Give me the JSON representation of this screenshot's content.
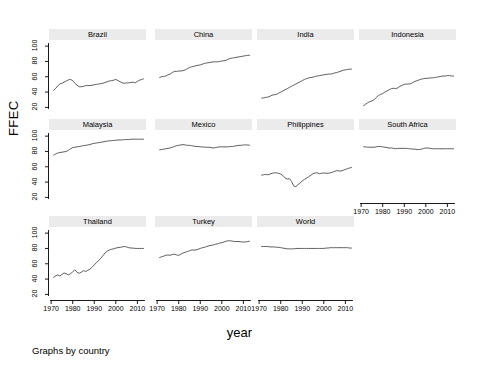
{
  "figure": {
    "ylabel": "FFEC",
    "xlabel": "year",
    "note": "Graphs by country",
    "line_color": "#4d4d4d",
    "title_band_color": "#ebebeb",
    "axis_color": "#000000"
  },
  "axes": {
    "yticks": [
      "100",
      "80",
      "60",
      "40",
      "20"
    ],
    "ytick_values": [
      100,
      80,
      60,
      40,
      20
    ],
    "xticks": [
      "1970",
      "1980",
      "1990",
      "2000",
      "2010"
    ],
    "xtick_values": [
      1970,
      1980,
      1990,
      2000,
      2010
    ],
    "ylim": [
      14,
      108
    ],
    "xlim": [
      1969,
      2014
    ]
  },
  "chart_data": {
    "type": "line",
    "title": "",
    "subtitle": "",
    "xlabel": "year",
    "ylabel": "FFEC",
    "note": "Graphs by country",
    "layout": {
      "rows": 3,
      "cols": 4,
      "shared_x": true,
      "shared_y": true,
      "grid": false,
      "legend": "none"
    },
    "xlim": [
      1969,
      2014
    ],
    "ylim": [
      14,
      108
    ],
    "panel_order": [
      "Brazil",
      "China",
      "India",
      "Indonesia",
      "Malaysia",
      "Mexico",
      "Philippines",
      "South Africa",
      "Thailand",
      "Turkey",
      "World"
    ],
    "x": [
      1971,
      1972,
      1973,
      1974,
      1975,
      1976,
      1977,
      1978,
      1979,
      1980,
      1981,
      1982,
      1983,
      1984,
      1985,
      1986,
      1987,
      1988,
      1989,
      1990,
      1991,
      1992,
      1993,
      1994,
      1995,
      1996,
      1997,
      1998,
      1999,
      2000,
      2001,
      2002,
      2003,
      2004,
      2005,
      2006,
      2007,
      2008,
      2009,
      2010,
      2011,
      2012,
      2013
    ],
    "series": [
      {
        "name": "Brazil",
        "values": [
          42.0,
          44.5,
          48.0,
          50.5,
          51.5,
          53.0,
          54.5,
          56.0,
          56.5,
          55.0,
          51.5,
          49.0,
          47.0,
          47.0,
          47.5,
          48.5,
          48.5,
          48.5,
          49.0,
          49.5,
          50.0,
          50.5,
          51.0,
          51.5,
          52.5,
          53.5,
          54.5,
          55.0,
          55.5,
          56.5,
          55.0,
          53.5,
          52.0,
          51.5,
          52.0,
          52.0,
          52.5,
          53.0,
          52.0,
          54.0,
          55.5,
          56.5,
          57.5
        ]
      },
      {
        "name": "China",
        "values": [
          59.0,
          60.0,
          60.5,
          61.0,
          62.5,
          63.5,
          65.5,
          67.0,
          67.0,
          67.5,
          67.5,
          68.0,
          69.0,
          70.5,
          72.0,
          73.0,
          73.5,
          74.5,
          75.0,
          75.5,
          76.5,
          77.5,
          78.0,
          78.5,
          79.0,
          79.5,
          79.5,
          79.5,
          80.0,
          80.5,
          81.0,
          81.5,
          83.0,
          84.0,
          84.5,
          85.0,
          85.5,
          86.0,
          86.5,
          87.0,
          87.5,
          88.0,
          88.0
        ]
      },
      {
        "name": "India",
        "values": [
          32.0,
          32.5,
          33.0,
          33.5,
          34.5,
          36.0,
          36.5,
          37.0,
          38.5,
          40.0,
          41.5,
          43.0,
          44.5,
          46.0,
          47.5,
          49.0,
          50.5,
          52.0,
          53.5,
          55.0,
          56.5,
          57.5,
          58.5,
          59.0,
          59.5,
          60.5,
          61.0,
          61.5,
          62.0,
          62.5,
          63.0,
          63.5,
          63.5,
          64.0,
          65.0,
          65.5,
          66.5,
          67.5,
          68.5,
          69.0,
          69.5,
          70.0,
          70.0
        ]
      },
      {
        "name": "Indonesia",
        "values": [
          22.0,
          24.0,
          26.0,
          27.5,
          28.5,
          30.0,
          33.0,
          35.5,
          37.0,
          38.0,
          40.0,
          41.5,
          43.0,
          44.5,
          45.0,
          44.5,
          45.5,
          47.5,
          49.0,
          50.0,
          50.5,
          50.5,
          51.0,
          52.5,
          54.0,
          55.0,
          56.0,
          57.0,
          57.5,
          58.0,
          58.0,
          58.5,
          58.5,
          59.0,
          59.5,
          60.0,
          60.5,
          61.0,
          61.0,
          61.5,
          61.5,
          61.0,
          61.0
        ]
      },
      {
        "name": "Malaysia",
        "values": [
          75.0,
          76.5,
          78.0,
          78.5,
          79.0,
          79.5,
          80.0,
          81.5,
          83.5,
          85.0,
          85.5,
          86.0,
          86.5,
          87.0,
          87.5,
          88.0,
          88.5,
          89.0,
          90.0,
          90.5,
          91.0,
          91.5,
          92.0,
          92.5,
          93.0,
          93.5,
          94.0,
          94.0,
          94.5,
          94.5,
          95.0,
          95.0,
          95.0,
          95.5,
          95.5,
          95.5,
          96.0,
          96.0,
          96.0,
          96.0,
          96.0,
          96.0,
          96.0
        ]
      },
      {
        "name": "Mexico",
        "values": [
          82.0,
          82.5,
          83.0,
          83.5,
          84.0,
          84.5,
          85.5,
          86.5,
          87.5,
          88.0,
          88.5,
          89.0,
          88.5,
          88.0,
          88.0,
          87.5,
          87.0,
          86.5,
          86.5,
          86.0,
          86.0,
          85.5,
          85.5,
          85.5,
          85.0,
          84.5,
          85.0,
          85.5,
          86.0,
          86.0,
          86.0,
          86.0,
          86.0,
          86.5,
          86.5,
          87.0,
          87.5,
          88.0,
          88.0,
          88.5,
          88.5,
          88.5,
          88.0
        ]
      },
      {
        "name": "Philippines",
        "values": [
          49.0,
          49.5,
          50.0,
          49.5,
          50.5,
          51.5,
          52.0,
          52.0,
          51.5,
          50.5,
          48.5,
          45.5,
          44.0,
          44.5,
          41.0,
          35.0,
          34.0,
          36.5,
          39.0,
          41.5,
          43.5,
          45.0,
          47.0,
          49.0,
          51.0,
          52.0,
          52.0,
          51.0,
          51.5,
          52.0,
          51.5,
          51.5,
          52.0,
          53.0,
          54.0,
          55.0,
          54.5,
          54.5,
          55.5,
          56.5,
          57.5,
          58.5,
          59.0
        ]
      },
      {
        "name": "South Africa",
        "values": [
          86.0,
          86.0,
          85.5,
          85.5,
          85.5,
          85.5,
          86.0,
          86.5,
          86.5,
          86.0,
          85.5,
          85.0,
          84.5,
          84.5,
          84.0,
          83.5,
          84.0,
          84.0,
          84.0,
          84.0,
          84.0,
          83.5,
          83.5,
          83.0,
          83.0,
          82.5,
          82.5,
          83.0,
          84.0,
          84.5,
          84.5,
          84.0,
          83.5,
          83.5,
          83.5,
          83.5,
          83.5,
          83.5,
          83.5,
          83.5,
          83.5,
          83.5,
          83.5
        ]
      },
      {
        "name": "Thailand",
        "values": [
          42.0,
          44.0,
          45.5,
          44.0,
          46.0,
          48.0,
          47.0,
          45.5,
          47.0,
          49.5,
          52.0,
          49.0,
          47.5,
          49.0,
          51.0,
          50.0,
          51.5,
          53.0,
          55.5,
          58.5,
          61.5,
          64.0,
          67.0,
          70.5,
          74.0,
          76.5,
          78.0,
          79.0,
          79.5,
          80.5,
          81.0,
          81.5,
          82.0,
          82.5,
          82.0,
          81.0,
          80.5,
          80.5,
          80.0,
          80.0,
          80.0,
          80.0,
          80.0
        ]
      },
      {
        "name": "Turkey",
        "values": [
          68.0,
          69.0,
          70.0,
          71.0,
          71.5,
          71.0,
          72.0,
          72.5,
          71.5,
          71.0,
          72.5,
          74.0,
          75.0,
          76.0,
          77.0,
          78.0,
          78.0,
          78.0,
          79.0,
          80.0,
          81.0,
          81.5,
          82.5,
          83.5,
          84.0,
          84.5,
          85.5,
          86.0,
          87.0,
          87.5,
          88.5,
          89.5,
          90.0,
          90.0,
          89.5,
          89.0,
          89.0,
          89.0,
          88.5,
          88.5,
          88.5,
          89.0,
          89.5
        ]
      },
      {
        "name": "World",
        "values": [
          82.5,
          82.5,
          82.5,
          82.5,
          82.0,
          82.0,
          82.0,
          81.5,
          81.5,
          81.0,
          80.5,
          80.0,
          79.5,
          79.5,
          79.5,
          79.5,
          80.0,
          80.0,
          80.0,
          80.0,
          80.0,
          80.0,
          80.0,
          80.0,
          80.0,
          80.0,
          80.0,
          80.0,
          80.0,
          80.0,
          80.5,
          80.5,
          81.0,
          81.0,
          81.0,
          81.0,
          81.0,
          81.0,
          81.0,
          81.0,
          81.0,
          80.5,
          80.5
        ]
      }
    ]
  }
}
